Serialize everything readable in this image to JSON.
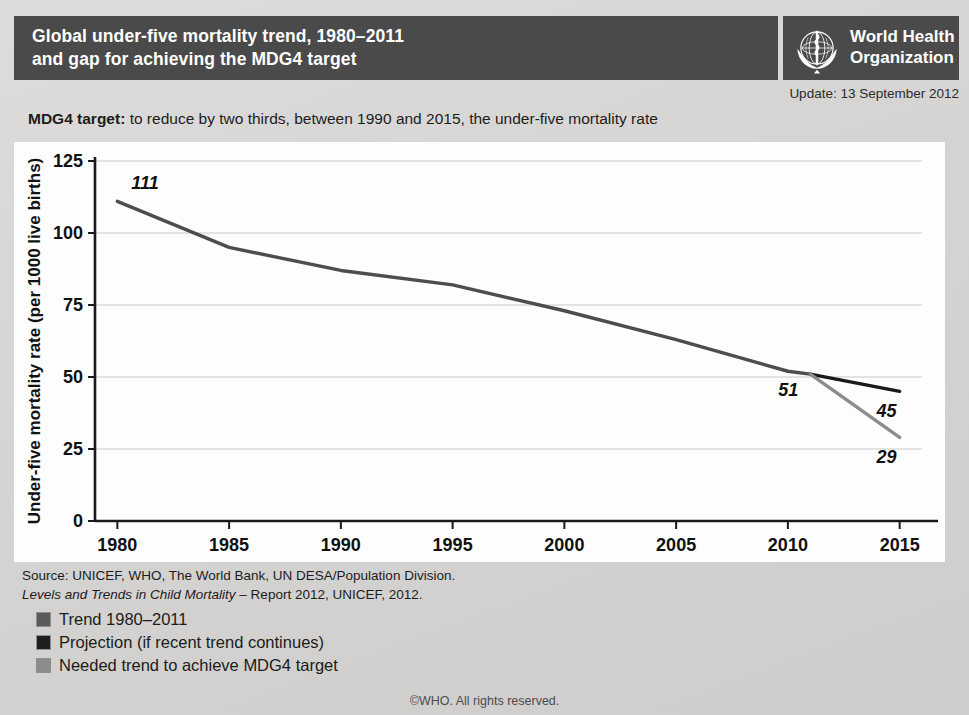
{
  "header": {
    "title": "Global under-five mortality trend, 1980–2011\nand gap for achieving the MDG4 target",
    "organization": "World Health\nOrganization",
    "emblem_icon": "who-emblem-icon"
  },
  "update": {
    "text": "Update: 13 September 2012"
  },
  "caption": {
    "lead": "MDG4 target:",
    "rest": " to reduce by two thirds, between 1990 and 2015, the under-five mortality rate"
  },
  "source": {
    "line1": "Source:  UNICEF, WHO, The World Bank, UN DESA/Population Division.",
    "line2_italic": "Levels and Trends in Child Mortality",
    "line2_rest": " – Report 2012, UNICEF, 2012."
  },
  "legend": {
    "items": [
      {
        "label": "Trend 1980–2011",
        "color": "#5a5a5a"
      },
      {
        "label": "Projection (if recent trend continues)",
        "color": "#1f1f1f"
      },
      {
        "label": "Needed trend to achieve MDG4 target",
        "color": "#8c8c8c"
      }
    ]
  },
  "footer": {
    "text": "©WHO.  All rights reserved."
  },
  "colors": {
    "header_bar": "#4a4a4a",
    "panel_background": "#fdfdfd",
    "page_background": "#d9d9d7",
    "trend_line": "#4d4d4d",
    "projection_line": "#1a1a1a",
    "needed_line": "#8c8c8c",
    "gridline": "#c9c9c9",
    "axis": "#1a1a1a"
  },
  "chart_data": {
    "type": "line",
    "title": "Global under-five mortality trend, 1980–2011 and gap for achieving the MDG4 target",
    "xlabel": "",
    "ylabel": "Under-five mortality rate (per 1000 live births)",
    "xlim": [
      1979,
      2016
    ],
    "ylim": [
      0,
      125
    ],
    "yticks": [
      0,
      25,
      50,
      75,
      100,
      125
    ],
    "xticks": [
      1980,
      1985,
      1990,
      1995,
      2000,
      2005,
      2010,
      2015
    ],
    "grid": "horizontal",
    "legend_position": "below-plot",
    "series": [
      {
        "name": "Trend 1980–2011",
        "color": "#4d4d4d",
        "x": [
          1980,
          1985,
          1990,
          1995,
          2000,
          2005,
          2010,
          2011
        ],
        "values": [
          111,
          95,
          87,
          82,
          73,
          63,
          52,
          51
        ]
      },
      {
        "name": "Projection (if recent trend continues)",
        "color": "#1a1a1a",
        "x": [
          2011,
          2015
        ],
        "values": [
          51,
          45
        ]
      },
      {
        "name": "Needed trend to achieve MDG4 target",
        "color": "#8c8c8c",
        "x": [
          2011,
          2015
        ],
        "values": [
          51,
          29
        ]
      }
    ],
    "annotations": [
      {
        "text": "111",
        "x": 1980,
        "y": 111,
        "position": "above-right"
      },
      {
        "text": "51",
        "x": 2011,
        "y": 51,
        "position": "below-left"
      },
      {
        "text": "45",
        "x": 2015,
        "y": 45,
        "position": "below-left"
      },
      {
        "text": "29",
        "x": 2015,
        "y": 29,
        "position": "below-left"
      }
    ]
  }
}
